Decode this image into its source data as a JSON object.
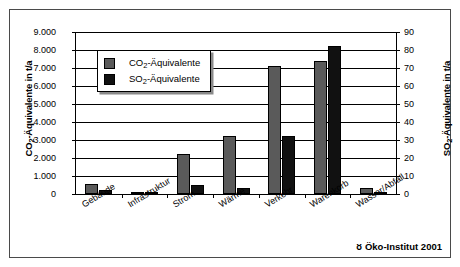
{
  "chart_data": {
    "type": "bar",
    "title": "",
    "categories": [
      "Gebäude",
      "Infrastruktur",
      "Strom",
      "Wärme",
      "Verkehr",
      "Warenkorb",
      "Wasser/Abfall"
    ],
    "series": [
      {
        "name": "CO₂-Äquivalente",
        "axis": "left",
        "color": "#5a5a5a",
        "values": [
          550,
          90,
          2200,
          3200,
          7100,
          7400,
          350
        ]
      },
      {
        "name": "SO₂-Äquivalente",
        "axis": "right",
        "color": "#111111",
        "values": [
          2.5,
          1.0,
          5.0,
          3.5,
          32.0,
          82.0,
          0.5
        ]
      }
    ],
    "xlabel": "",
    "ylabel": "CO₂-Äquivalente in t/a",
    "ylabel_right": "SO₂-Äquivalente in t/a",
    "ylim": [
      0,
      9000
    ],
    "ylim_right": [
      0,
      90
    ],
    "ytick_labels_left": [
      "9.000",
      "8.000",
      "7.000",
      "6.000",
      "5.000",
      "4.000",
      "3.000",
      "2.000",
      "1.000",
      "0"
    ],
    "ytick_labels_right": [
      "90",
      "80",
      "70",
      "60",
      "50",
      "40",
      "30",
      "20",
      "10",
      "0"
    ],
    "grid": true,
    "legend_position": "upper-left-inside"
  },
  "axes": {
    "left_title_main": "CO",
    "left_title_sub": "2",
    "left_title_rest": "-Äquivalente in t/a",
    "right_title_main": "SO",
    "right_title_sub": "2",
    "right_title_rest": "-Äquivalente in t/a"
  },
  "legend": {
    "items": [
      {
        "label_main": "CO",
        "label_sub": "2",
        "label_rest": "-Äquivalente",
        "swatch": "co2-swatch"
      },
      {
        "label_main": "SO",
        "label_sub": "2",
        "label_rest": "-Äquivalente",
        "swatch": "so2-swatch"
      }
    ]
  },
  "footer": {
    "logo_glyph": "ᴕ",
    "text": "Öko-Institut 2001"
  }
}
